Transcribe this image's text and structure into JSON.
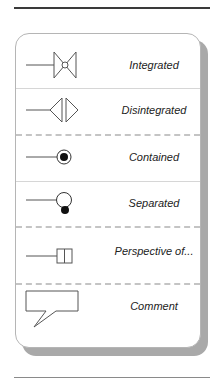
{
  "legend": {
    "items": [
      {
        "id": "integrated",
        "label": "Integrated",
        "icon": "integrated-bowtie-icon"
      },
      {
        "id": "disintegrated",
        "label": "Disintegrated",
        "icon": "disintegrated-split-triangles-icon"
      },
      {
        "id": "contained",
        "label": "Contained",
        "icon": "contained-circle-dot-icon"
      },
      {
        "id": "separated",
        "label": "Separated",
        "icon": "separated-circle-offset-dot-icon"
      },
      {
        "id": "perspective",
        "label": "Perspective of...",
        "icon": "perspective-box-icon"
      },
      {
        "id": "comment",
        "label": "Comment",
        "icon": "comment-callout-icon"
      }
    ],
    "separators": [
      "solid",
      "dashed",
      "solid",
      "dashed",
      "dashed"
    ]
  },
  "colors": {
    "stroke": "#555555",
    "fill_dot": "#111111",
    "shadow": "#a9a9a9",
    "card_border": "#b5b5b5"
  }
}
